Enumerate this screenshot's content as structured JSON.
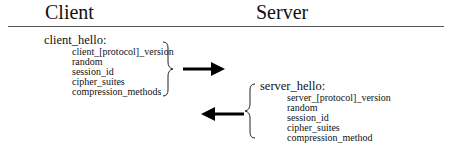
{
  "headers": {
    "client": "Client",
    "server": "Server"
  },
  "client_hello": {
    "title": "client_hello:",
    "fields": [
      "client_[protocol]_version",
      "random",
      "session_id",
      "cipher_suites",
      "compression_methods"
    ]
  },
  "server_hello": {
    "title": "server_hello:",
    "fields": [
      "server_[protocol]_version",
      "random",
      "session_id",
      "cipher_suites",
      "compression_method"
    ]
  },
  "arrows": [
    {
      "direction": "right",
      "meaning": "client to server"
    },
    {
      "direction": "left",
      "meaning": "server to client"
    }
  ]
}
